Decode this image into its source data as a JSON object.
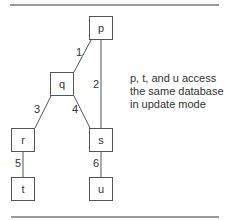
{
  "diagram": {
    "nodes": [
      {
        "id": "p",
        "label": "p"
      },
      {
        "id": "q",
        "label": "q"
      },
      {
        "id": "r",
        "label": "r"
      },
      {
        "id": "s",
        "label": "s"
      },
      {
        "id": "t",
        "label": "t"
      },
      {
        "id": "u",
        "label": "u"
      }
    ],
    "edges": [
      {
        "label": "1",
        "from": "p",
        "to": "q"
      },
      {
        "label": "2",
        "from": "p",
        "to": "s"
      },
      {
        "label": "3",
        "from": "q",
        "to": "r"
      },
      {
        "label": "4",
        "from": "q",
        "to": "s"
      },
      {
        "label": "5",
        "from": "r",
        "to": "t"
      },
      {
        "label": "6",
        "from": "s",
        "to": "u"
      }
    ],
    "note": {
      "lines": [
        "p, t, and u access",
        "the same database",
        "in update mode"
      ]
    }
  }
}
